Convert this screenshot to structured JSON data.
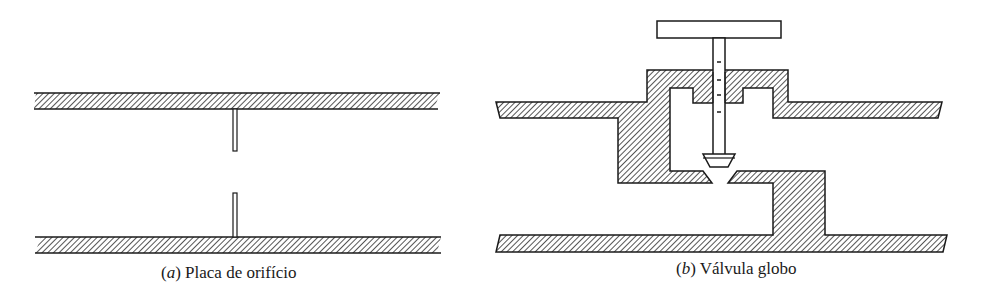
{
  "figures": [
    {
      "id": "a",
      "letter": "a",
      "label": "Placa de orifício",
      "component": "orifice-plate"
    },
    {
      "id": "b",
      "letter": "b",
      "label": "Válvula globo",
      "component": "globe-valve"
    }
  ],
  "colors": {
    "stroke": "#1a1a1a",
    "hatch": "#2a2a2a",
    "background": "#ffffff"
  }
}
